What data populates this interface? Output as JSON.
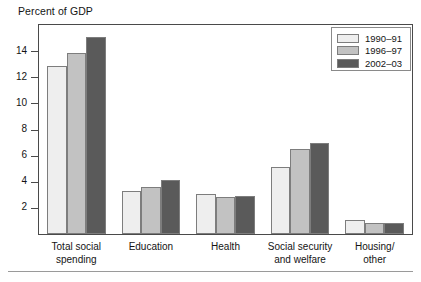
{
  "chart_data": {
    "type": "bar",
    "title": "Percent of GDP",
    "xlabel": "",
    "ylabel": "Percent of GDP",
    "ylim": [
      0,
      16
    ],
    "yticks": [
      2,
      4,
      6,
      8,
      10,
      12,
      14
    ],
    "ytick_labels": [
      "2",
      "4",
      "6",
      "8",
      "10",
      "12",
      "14"
    ],
    "grid": false,
    "legend_position": "top-right",
    "categories": [
      "Total social spending",
      "Education",
      "Health",
      "Social security and welfare",
      "Housing/ other"
    ],
    "category_labels": [
      [
        "Total social",
        "spending"
      ],
      [
        "Education",
        ""
      ],
      [
        "Health",
        ""
      ],
      [
        "Social security",
        "and welfare"
      ],
      [
        "Housing/",
        "other"
      ]
    ],
    "series": [
      {
        "name": "1990–91",
        "color": "#eeeeee",
        "values": [
          12.9,
          3.3,
          3.1,
          5.1,
          1.1
        ]
      },
      {
        "name": "1996–97",
        "color": "#c2c2c2",
        "values": [
          13.85,
          3.6,
          2.8,
          6.5,
          0.85
        ]
      },
      {
        "name": "2002–03",
        "color": "#5a5a5a",
        "values": [
          15.1,
          4.1,
          2.9,
          7.0,
          0.85
        ]
      }
    ]
  },
  "legend": {
    "items": [
      {
        "label": "1990–91"
      },
      {
        "label": "1996–97"
      },
      {
        "label": "2002–03"
      }
    ]
  }
}
